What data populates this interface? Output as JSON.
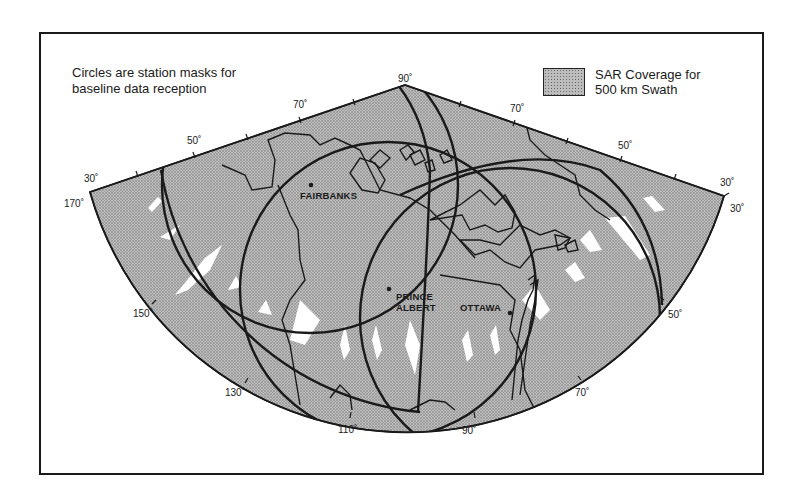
{
  "figure": {
    "note_line1": "Circles are station masks for",
    "note_line2": "baseline data reception",
    "legend": {
      "label_line1": "SAR Coverage for",
      "label_line2": "500 km Swath",
      "swatch": "stippled-gray"
    },
    "latitude_labels": {
      "top_center": "90˚",
      "left_upper_70": "70˚",
      "left_50": "50˚",
      "left_30": "30˚",
      "right_upper_70": "70˚",
      "right_50": "50˚",
      "right_30": "30˚"
    },
    "longitude_labels": {
      "lon_170": "170˚",
      "lon_150": "150˚",
      "lon_130": "130˚",
      "lon_110": "110˚",
      "lon_90": "90˚",
      "lon_70": "70˚",
      "lon_50": "50˚",
      "lon_30": "30˚"
    },
    "stations": [
      {
        "name": "FAIRBANKS"
      },
      {
        "name_line1": "PRINCE",
        "name_line2": "ALBERT"
      },
      {
        "name": "OTTAWA"
      }
    ],
    "colors": {
      "coverage_fill": "#bdbdbd",
      "stipple": "#6b6b6b",
      "lines": "#1a1a1a",
      "gaps": "#ffffff"
    }
  }
}
